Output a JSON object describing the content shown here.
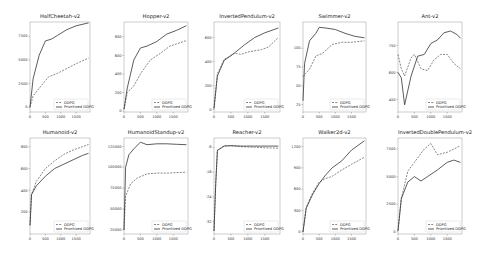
{
  "legend": {
    "ddpg": "DDPG",
    "prioritized": "Prioritized DDPG"
  },
  "colors": {
    "ddpg": "#555555",
    "prioritized": "#333333",
    "axis": "#888888"
  },
  "chart_data": [
    {
      "type": "line",
      "title": "HalfCheetah-v2",
      "xticks": [
        0,
        500,
        1000,
        1500
      ],
      "xlim": [
        0,
        1950
      ],
      "yticks": [
        0,
        2500,
        5000,
        7500
      ],
      "ylim": [
        -500,
        9000
      ],
      "series": [
        {
          "name": "DDPG",
          "x": [
            0,
            100,
            300,
            600,
            900,
            1200,
            1500,
            1900
          ],
          "y": [
            0,
            1200,
            2000,
            3200,
            3600,
            4100,
            4600,
            5200
          ]
        },
        {
          "name": "Prioritized DDPG",
          "x": [
            0,
            100,
            300,
            500,
            700,
            900,
            1200,
            1500,
            1900
          ],
          "y": [
            0,
            3000,
            5500,
            7000,
            7200,
            7600,
            8200,
            8600,
            8900
          ]
        }
      ]
    },
    {
      "type": "line",
      "title": "Hopper-v2",
      "xticks": [
        0,
        500,
        1000,
        1500
      ],
      "xlim": [
        0,
        1950
      ],
      "yticks": [
        0,
        200,
        400,
        600,
        800
      ],
      "ylim": [
        -10,
        960
      ],
      "series": [
        {
          "name": "DDPG",
          "x": [
            0,
            100,
            300,
            500,
            800,
            1100,
            1400,
            1900
          ],
          "y": [
            20,
            200,
            270,
            400,
            550,
            620,
            700,
            760
          ]
        },
        {
          "name": "Prioritized DDPG",
          "x": [
            0,
            100,
            300,
            500,
            700,
            1000,
            1300,
            1600,
            1900
          ],
          "y": [
            20,
            250,
            550,
            680,
            700,
            750,
            830,
            870,
            920
          ]
        }
      ]
    },
    {
      "type": "line",
      "title": "InvertedPendulum-v2",
      "xticks": [
        0,
        500,
        1000,
        1500
      ],
      "xlim": [
        0,
        1950
      ],
      "yticks": [
        0,
        200,
        400,
        600
      ],
      "ylim": [
        -20,
        730
      ],
      "series": [
        {
          "name": "DDPG",
          "x": [
            0,
            100,
            300,
            450,
            600,
            800,
            1000,
            1200,
            1400,
            1600,
            1900
          ],
          "y": [
            10,
            300,
            420,
            440,
            470,
            460,
            480,
            490,
            500,
            520,
            600
          ]
        },
        {
          "name": "Prioritized DDPG",
          "x": [
            0,
            100,
            300,
            600,
            900,
            1200,
            1500,
            1900
          ],
          "y": [
            10,
            280,
            410,
            470,
            540,
            600,
            640,
            680
          ]
        }
      ]
    },
    {
      "type": "line",
      "title": "Swimmer-v2",
      "xticks": [
        0,
        500,
        1000,
        1500
      ],
      "xlim": [
        0,
        1950
      ],
      "yticks": [
        25,
        50,
        75,
        100
      ],
      "ylim": [
        15,
        135
      ],
      "series": [
        {
          "name": "DDPG",
          "x": [
            0,
            50,
            200,
            400,
            600,
            900,
            1200,
            1500,
            1900
          ],
          "y": [
            62,
            65,
            72,
            90,
            93,
            105,
            108,
            108,
            110
          ]
        },
        {
          "name": "Prioritized DDPG",
          "x": [
            0,
            50,
            200,
            400,
            500,
            700,
            1000,
            1300,
            1600,
            1900
          ],
          "y": [
            30,
            80,
            110,
            120,
            128,
            127,
            125,
            120,
            116,
            114
          ]
        }
      ]
    },
    {
      "type": "line",
      "title": "Ant-v2",
      "xticks": [
        0,
        500,
        1000,
        1500
      ],
      "xlim": [
        0,
        1950
      ],
      "yticks": [
        450,
        600,
        750
      ],
      "ylim": [
        380,
        880
      ],
      "series": [
        {
          "name": "DDPG",
          "x": [
            0,
            100,
            200,
            400,
            500,
            700,
            900,
            1100,
            1300,
            1500,
            1700,
            1900
          ],
          "y": [
            700,
            620,
            580,
            680,
            700,
            620,
            610,
            670,
            700,
            700,
            650,
            620
          ]
        },
        {
          "name": "Prioritized DDPG",
          "x": [
            0,
            100,
            200,
            400,
            600,
            800,
            1000,
            1200,
            1400,
            1600,
            1800,
            1900
          ],
          "y": [
            600,
            570,
            420,
            580,
            690,
            700,
            760,
            780,
            820,
            830,
            810,
            790
          ]
        }
      ]
    },
    {
      "type": "line",
      "title": "Humanoid-v2",
      "xticks": [
        0,
        500,
        1000,
        1500
      ],
      "xlim": [
        0,
        1950
      ],
      "yticks": [
        200,
        400,
        600,
        800
      ],
      "ylim": [
        0,
        880
      ],
      "series": [
        {
          "name": "DDPG",
          "x": [
            0,
            50,
            200,
            500,
            800,
            1100,
            1400,
            1700,
            1900
          ],
          "y": [
            80,
            360,
            480,
            600,
            670,
            730,
            770,
            800,
            820
          ]
        },
        {
          "name": "Prioritized DDPG",
          "x": [
            0,
            50,
            200,
            500,
            800,
            1100,
            1400,
            1700,
            1900
          ],
          "y": [
            80,
            360,
            440,
            530,
            600,
            640,
            680,
            720,
            740
          ]
        }
      ]
    },
    {
      "type": "line",
      "title": "HumanoidStandup-v2",
      "xticks": [
        0,
        500,
        1000,
        1500
      ],
      "xlim": [
        0,
        1950
      ],
      "yticks": [
        25000,
        50000,
        75000,
        100000,
        125000
      ],
      "ylim": [
        20000,
        135000
      ],
      "series": [
        {
          "name": "DDPG",
          "x": [
            0,
            50,
            200,
            400,
            700,
            1000,
            1300,
            1600,
            1900
          ],
          "y": [
            25000,
            65000,
            80000,
            87000,
            92000,
            93000,
            93000,
            93500,
            94000
          ]
        },
        {
          "name": "Prioritized DDPG",
          "x": [
            0,
            50,
            150,
            300,
            500,
            700,
            1000,
            1300,
            1600,
            1900
          ],
          "y": [
            25000,
            100000,
            115000,
            122000,
            130000,
            127000,
            128000,
            128000,
            127500,
            127000
          ]
        }
      ]
    },
    {
      "type": "line",
      "title": "Reacher-v2",
      "xticks": [
        0,
        500,
        1000,
        1500
      ],
      "xlim": [
        0,
        1950
      ],
      "yticks": [
        -32,
        -24,
        -16,
        -8
      ],
      "ylim": [
        -36,
        -5
      ],
      "series": [
        {
          "name": "DDPG",
          "x": [
            0,
            50,
            100,
            300,
            500,
            800,
            1200,
            1600,
            1900
          ],
          "y": [
            -35,
            -20,
            -9,
            -7.5,
            -7.5,
            -7.8,
            -8,
            -8.2,
            -8.3
          ]
        },
        {
          "name": "Prioritized DDPG",
          "x": [
            0,
            50,
            100,
            300,
            500,
            800,
            1200,
            1600,
            1900
          ],
          "y": [
            -35,
            -20,
            -9,
            -7.6,
            -7.5,
            -7.6,
            -7.6,
            -7.6,
            -7.6
          ]
        }
      ]
    },
    {
      "type": "line",
      "title": "Walker2d-v2",
      "xticks": [
        0,
        500,
        1000,
        1500
      ],
      "xlim": [
        0,
        1950
      ],
      "yticks": [
        0,
        300,
        600,
        900,
        1200
      ],
      "ylim": [
        -30,
        1320
      ],
      "series": [
        {
          "name": "DDPG",
          "x": [
            0,
            100,
            300,
            500,
            700,
            900,
            1200,
            1500,
            1900
          ],
          "y": [
            0,
            350,
            550,
            700,
            750,
            780,
            870,
            950,
            1050
          ]
        },
        {
          "name": "Prioritized DDPG",
          "x": [
            0,
            100,
            300,
            500,
            700,
            900,
            1200,
            1500,
            1900
          ],
          "y": [
            0,
            330,
            530,
            680,
            800,
            900,
            1000,
            1150,
            1280
          ]
        }
      ]
    },
    {
      "type": "line",
      "title": "InvertedDoublePendulum-v2",
      "xticks": [
        0,
        500,
        1000,
        1500
      ],
      "xlim": [
        0,
        1950
      ],
      "yticks": [
        0,
        2500,
        5000,
        7500
      ],
      "ylim": [
        -200,
        8500
      ],
      "series": [
        {
          "name": "DDPG",
          "x": [
            0,
            100,
            300,
            500,
            800,
            1000,
            1200,
            1500,
            1900
          ],
          "y": [
            100,
            3000,
            5500,
            6300,
            7500,
            8000,
            7000,
            7200,
            7800
          ]
        },
        {
          "name": "Prioritized DDPG",
          "x": [
            0,
            100,
            300,
            500,
            700,
            900,
            1200,
            1500,
            1700,
            1900
          ],
          "y": [
            100,
            3000,
            4500,
            5000,
            4600,
            5000,
            5600,
            6300,
            6500,
            6300
          ]
        }
      ]
    }
  ]
}
